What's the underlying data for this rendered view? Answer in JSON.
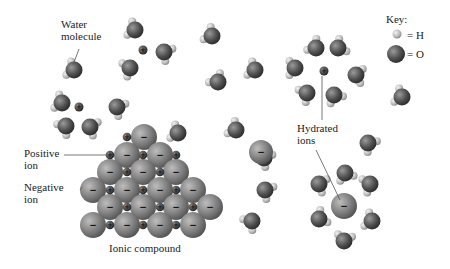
{
  "labels": {
    "water_molecule": "Water\nmolecule",
    "positive_ion": "Positive\nion",
    "negative_ion": "Negative\nion",
    "hydrated_ions": "Hydrated\nions",
    "ionic_compound": "Ionic compound"
  },
  "key": {
    "title": "Key:",
    "h_label": "= H",
    "o_label": "= O"
  },
  "symbols": {
    "plus": "+",
    "minus": "−"
  },
  "colors": {
    "background": "#ffffff",
    "oxygen": "#555555",
    "hydrogen": "#bdbdbd",
    "anion": "#7a7a7a",
    "cation": "#4a4a4a",
    "leader_line": "#555555",
    "text": "#222222"
  }
}
